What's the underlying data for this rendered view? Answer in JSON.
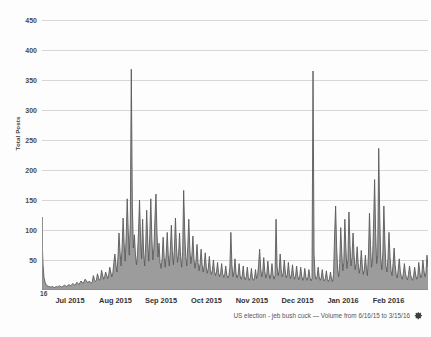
{
  "chart_data": {
    "type": "area",
    "title": "",
    "xlabel": "",
    "ylabel": "Total Posts",
    "ylim": [
      0,
      460
    ],
    "yticks": [
      50,
      100,
      150,
      200,
      250,
      300,
      350,
      400,
      450
    ],
    "grid": true,
    "legend": "none",
    "x_origin_label": "16",
    "x_tick_labels": [
      "Jul 2015",
      "Aug 2015",
      "Sep 2015",
      "Oct 2015",
      "Nov 2015",
      "Dec 2015",
      "Jan 2016",
      "Feb 2016"
    ],
    "x_range": "6/16/15 to 3/15/16",
    "series": [
      {
        "name": "US election - jeb bush cuck",
        "fill_color": "#9c9c9c",
        "line_color": "#5a5a5a",
        "values": [
          88,
          42,
          20,
          13,
          9,
          7,
          6,
          6,
          5,
          5,
          6,
          5,
          4,
          5,
          6,
          5,
          6,
          7,
          6,
          5,
          6,
          7,
          8,
          7,
          6,
          7,
          9,
          8,
          7,
          9,
          11,
          9,
          8,
          10,
          13,
          11,
          9,
          12,
          15,
          13,
          11,
          14,
          18,
          16,
          13,
          12,
          15,
          13,
          11,
          14,
          24,
          18,
          14,
          16,
          27,
          21,
          16,
          19,
          33,
          25,
          18,
          22,
          30,
          24,
          19,
          26,
          38,
          30,
          22,
          28,
          46,
          60,
          42,
          30,
          55,
          95,
          64,
          40,
          70,
          120,
          78,
          48,
          88,
          152,
          99,
          58,
          110,
          368,
          140,
          70,
          92,
          60,
          42,
          58,
          96,
          150,
          88,
          52,
          118,
          62,
          40,
          75,
          133,
          80,
          48,
          92,
          152,
          86,
          50,
          70,
          118,
          160,
          96,
          55,
          78,
          46,
          36,
          52,
          88,
          54,
          38,
          60,
          96,
          58,
          40,
          66,
          108,
          64,
          42,
          70,
          120,
          72,
          46,
          58,
          95,
          56,
          38,
          64,
          166,
          98,
          56,
          40,
          72,
          118,
          68,
          44,
          58,
          90,
          52,
          36,
          48,
          76,
          46,
          32,
          44,
          68,
          42,
          30,
          40,
          62,
          38,
          28,
          36,
          56,
          34,
          26,
          33,
          50,
          31,
          24,
          30,
          46,
          29,
          22,
          28,
          44,
          27,
          21,
          26,
          40,
          25,
          20,
          24,
          38,
          96,
          42,
          22,
          30,
          52,
          28,
          20,
          26,
          44,
          24,
          18,
          23,
          40,
          22,
          17,
          22,
          38,
          21,
          16,
          21,
          36,
          20,
          16,
          20,
          34,
          19,
          24,
          42,
          68,
          36,
          22,
          30,
          54,
          31,
          20,
          27,
          48,
          28,
          19,
          25,
          44,
          26,
          18,
          24,
          118,
          40,
          24,
          32,
          60,
          34,
          22,
          28,
          50,
          30,
          20,
          26,
          46,
          27,
          19,
          25,
          42,
          25,
          18,
          23,
          40,
          24,
          17,
          22,
          38,
          23,
          16,
          21,
          36,
          22,
          16,
          20,
          34,
          21,
          15,
          19,
          365,
          60,
          25,
          18,
          22,
          38,
          22,
          16,
          20,
          34,
          20,
          15,
          19,
          32,
          19,
          14,
          18,
          30,
          18,
          14,
          26,
          90,
          140,
          72,
          34,
          22,
          44,
          104,
          62,
          32,
          46,
          118,
          70,
          36,
          50,
          130,
          76,
          40,
          54,
          95,
          58,
          34,
          44,
          72,
          44,
          28,
          38,
          66,
          40,
          26,
          34,
          58,
          36,
          24,
          60,
          128,
          74,
          38,
          50,
          110,
          184,
          96,
          44,
          58,
          236,
          120,
          52,
          34,
          62,
          140,
          80,
          40,
          30,
          52,
          96,
          56,
          32,
          24,
          44,
          70,
          42,
          26,
          20,
          34,
          52,
          32,
          22,
          18,
          28,
          44,
          28,
          20,
          17,
          26,
          40,
          26,
          19,
          16,
          24,
          38,
          25,
          18,
          22,
          46,
          30,
          20,
          26,
          50,
          33,
          22,
          28,
          58,
          38
        ]
      }
    ]
  },
  "caption": {
    "text": "US election - jeb bush cuck — Volume from 6/16/15 to 3/15/16",
    "settings_icon": "gear-icon"
  },
  "colors": {
    "background": "#fdfdfd",
    "gridline": "#d7d7d7",
    "axis": "#8f8f8f",
    "tick_text": "#4a4a4a",
    "caption_text": "#555555"
  }
}
